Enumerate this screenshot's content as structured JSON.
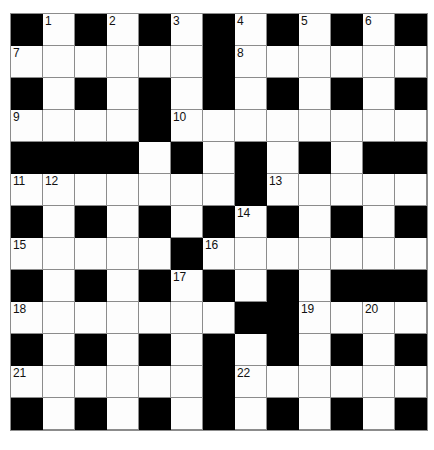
{
  "puzzle": {
    "title": "Crossword Grid",
    "columns": 13,
    "rows": 13,
    "cell_size_px": 32,
    "colors": {
      "white_cell": "#fdfdfd",
      "black_cell": "#000000",
      "grid_line": "#8c8c8c",
      "number_text": "#111111",
      "page_background": "#ffffff"
    },
    "clue_numbers_present": [
      1,
      2,
      3,
      4,
      5,
      6,
      7,
      8,
      9,
      10,
      11,
      12,
      13,
      14,
      15,
      16,
      17,
      18,
      19,
      20,
      21,
      22
    ],
    "grid": [
      [
        {
          "type": "black"
        },
        {
          "type": "white",
          "number": "1"
        },
        {
          "type": "black"
        },
        {
          "type": "white",
          "number": "2"
        },
        {
          "type": "black"
        },
        {
          "type": "white",
          "number": "3"
        },
        {
          "type": "black"
        },
        {
          "type": "white",
          "number": "4"
        },
        {
          "type": "black"
        },
        {
          "type": "white",
          "number": "5"
        },
        {
          "type": "black"
        },
        {
          "type": "white",
          "number": "6"
        },
        {
          "type": "black"
        }
      ],
      [
        {
          "type": "white",
          "number": "7"
        },
        {
          "type": "white"
        },
        {
          "type": "white"
        },
        {
          "type": "white"
        },
        {
          "type": "white"
        },
        {
          "type": "white"
        },
        {
          "type": "black"
        },
        {
          "type": "white",
          "number": "8"
        },
        {
          "type": "white"
        },
        {
          "type": "white"
        },
        {
          "type": "white"
        },
        {
          "type": "white"
        },
        {
          "type": "white"
        }
      ],
      [
        {
          "type": "black"
        },
        {
          "type": "white"
        },
        {
          "type": "black"
        },
        {
          "type": "white"
        },
        {
          "type": "black"
        },
        {
          "type": "white"
        },
        {
          "type": "black"
        },
        {
          "type": "white"
        },
        {
          "type": "black"
        },
        {
          "type": "white"
        },
        {
          "type": "black"
        },
        {
          "type": "white"
        },
        {
          "type": "black"
        }
      ],
      [
        {
          "type": "white",
          "number": "9"
        },
        {
          "type": "white"
        },
        {
          "type": "white"
        },
        {
          "type": "white"
        },
        {
          "type": "black"
        },
        {
          "type": "white",
          "number": "10"
        },
        {
          "type": "white"
        },
        {
          "type": "white"
        },
        {
          "type": "white"
        },
        {
          "type": "white"
        },
        {
          "type": "white"
        },
        {
          "type": "white"
        },
        {
          "type": "white"
        }
      ],
      [
        {
          "type": "black"
        },
        {
          "type": "black"
        },
        {
          "type": "black"
        },
        {
          "type": "black"
        },
        {
          "type": "white"
        },
        {
          "type": "black"
        },
        {
          "type": "white"
        },
        {
          "type": "black"
        },
        {
          "type": "white"
        },
        {
          "type": "black"
        },
        {
          "type": "white"
        },
        {
          "type": "black"
        },
        {
          "type": "black"
        }
      ],
      [
        {
          "type": "white",
          "number": "11"
        },
        {
          "type": "white",
          "number": "12"
        },
        {
          "type": "white"
        },
        {
          "type": "white"
        },
        {
          "type": "white"
        },
        {
          "type": "white"
        },
        {
          "type": "white"
        },
        {
          "type": "black"
        },
        {
          "type": "white",
          "number": "13"
        },
        {
          "type": "white"
        },
        {
          "type": "white"
        },
        {
          "type": "white"
        },
        {
          "type": "white"
        }
      ],
      [
        {
          "type": "black"
        },
        {
          "type": "white"
        },
        {
          "type": "black"
        },
        {
          "type": "white"
        },
        {
          "type": "black"
        },
        {
          "type": "white"
        },
        {
          "type": "black"
        },
        {
          "type": "white",
          "number": "14"
        },
        {
          "type": "black"
        },
        {
          "type": "white"
        },
        {
          "type": "black"
        },
        {
          "type": "white"
        },
        {
          "type": "black"
        }
      ],
      [
        {
          "type": "white",
          "number": "15"
        },
        {
          "type": "white"
        },
        {
          "type": "white"
        },
        {
          "type": "white"
        },
        {
          "type": "white"
        },
        {
          "type": "black"
        },
        {
          "type": "white",
          "number": "16"
        },
        {
          "type": "white"
        },
        {
          "type": "white"
        },
        {
          "type": "white"
        },
        {
          "type": "white"
        },
        {
          "type": "white"
        },
        {
          "type": "white"
        }
      ],
      [
        {
          "type": "black"
        },
        {
          "type": "white"
        },
        {
          "type": "black"
        },
        {
          "type": "white"
        },
        {
          "type": "black"
        },
        {
          "type": "white",
          "number": "17"
        },
        {
          "type": "black"
        },
        {
          "type": "white"
        },
        {
          "type": "black"
        },
        {
          "type": "white"
        },
        {
          "type": "black"
        },
        {
          "type": "black"
        },
        {
          "type": "black"
        }
      ],
      [
        {
          "type": "white",
          "number": "18"
        },
        {
          "type": "white"
        },
        {
          "type": "white"
        },
        {
          "type": "white"
        },
        {
          "type": "white"
        },
        {
          "type": "white"
        },
        {
          "type": "white"
        },
        {
          "type": "black"
        },
        {
          "type": "black"
        },
        {
          "type": "white",
          "number": "19"
        },
        {
          "type": "white"
        },
        {
          "type": "white",
          "number": "20"
        },
        {
          "type": "white"
        }
      ],
      [
        {
          "type": "black"
        },
        {
          "type": "white"
        },
        {
          "type": "black"
        },
        {
          "type": "white"
        },
        {
          "type": "black"
        },
        {
          "type": "white"
        },
        {
          "type": "black"
        },
        {
          "type": "white"
        },
        {
          "type": "black"
        },
        {
          "type": "white"
        },
        {
          "type": "black"
        },
        {
          "type": "white"
        },
        {
          "type": "black"
        }
      ],
      [
        {
          "type": "white",
          "number": "21"
        },
        {
          "type": "white"
        },
        {
          "type": "white"
        },
        {
          "type": "white"
        },
        {
          "type": "white"
        },
        {
          "type": "white"
        },
        {
          "type": "black"
        },
        {
          "type": "white",
          "number": "22"
        },
        {
          "type": "white"
        },
        {
          "type": "white"
        },
        {
          "type": "white"
        },
        {
          "type": "white"
        },
        {
          "type": "white"
        }
      ],
      [
        {
          "type": "black"
        },
        {
          "type": "white"
        },
        {
          "type": "black"
        },
        {
          "type": "white"
        },
        {
          "type": "black"
        },
        {
          "type": "white"
        },
        {
          "type": "black"
        },
        {
          "type": "white"
        },
        {
          "type": "black"
        },
        {
          "type": "white"
        },
        {
          "type": "black"
        },
        {
          "type": "white"
        },
        {
          "type": "black"
        }
      ]
    ]
  }
}
